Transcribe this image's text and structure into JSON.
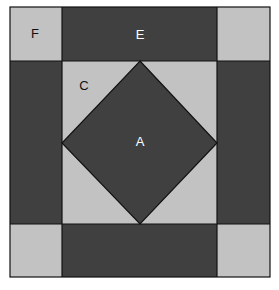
{
  "diagram": {
    "title": "",
    "colors": {
      "dark": "#404040",
      "light": "#c2c2c2",
      "stroke": "#111111",
      "background": "#ffffff"
    },
    "labels": {
      "F": "F",
      "E": "E",
      "C": "C",
      "A": "A"
    },
    "regions": [
      {
        "id": "F",
        "shape": "square",
        "position": "top-left corner",
        "fill": "light"
      },
      {
        "id": "E",
        "shape": "rectangle",
        "position": "top edge",
        "fill": "dark"
      },
      {
        "id": "C",
        "shape": "triangle",
        "position": "corner of inner square",
        "fill": "light"
      },
      {
        "id": "A",
        "shape": "diamond",
        "position": "center",
        "fill": "dark"
      }
    ]
  }
}
